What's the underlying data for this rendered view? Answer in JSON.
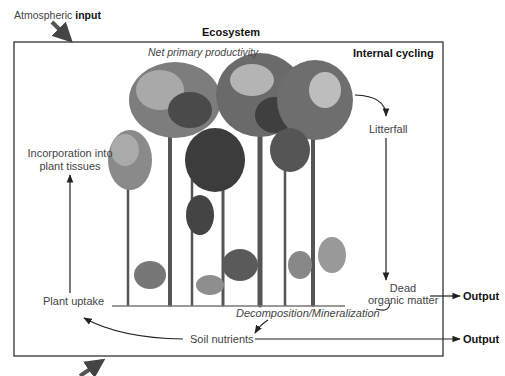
{
  "title": "Ecosystem",
  "atmospheric_input": {
    "prefix": "Atmospheric",
    "emphasis": "input"
  },
  "box": {
    "top_center_label": "Net primary productivity",
    "top_right_label": "Internal cycling"
  },
  "nodes": {
    "litterfall": "Litterfall",
    "dead_organic_matter_line1": "Dead",
    "dead_organic_matter_line2": "organic matter",
    "decomposition": "Decomposition/Mineralization",
    "soil_nutrients": "Soil nutrients",
    "plant_uptake": "Plant uptake",
    "incorporation_line1": "Incorporation into",
    "incorporation_line2": "plant tissues"
  },
  "outputs": {
    "output_1": "Output",
    "output_2": "Output"
  },
  "colors": {
    "stroke": "#222222",
    "box_border": "#333333",
    "text": "#444444",
    "foliage_dark": "#3a3a3a",
    "foliage_mid": "#6e6e6e",
    "foliage_light": "#a8a8a8"
  }
}
